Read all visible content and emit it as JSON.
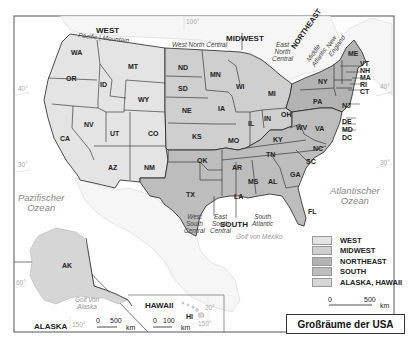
{
  "map": {
    "title": "Großräume der USA",
    "colors": {
      "west": "#e4e4e4",
      "midwest": "#cfcfcf",
      "northeast": "#b3b3b3",
      "south": "#bdbdbd",
      "alaska_hawaii": "#d6d6d6",
      "land_outside": "#f5f5f5",
      "water": "#ffffff",
      "border": "#222222"
    },
    "regions": {
      "west": {
        "label": "WEST",
        "divisions": [
          "Pacific",
          "Mountain"
        ]
      },
      "midwest": {
        "label": "MIDWEST",
        "divisions": [
          "West North Central",
          "East North Central"
        ]
      },
      "northeast": {
        "label": "NORTHEAST",
        "divisions": [
          "Middle Atlantic",
          "New England"
        ]
      },
      "south": {
        "label": "SOUTH",
        "divisions": [
          "West South Central",
          "East South Central",
          "South Atlantic"
        ]
      }
    },
    "division_labels": {
      "pacific_mountain": "Pacific | Mountain",
      "west_north_central": "West North Central",
      "east_north_central": [
        "East",
        "North",
        "Central"
      ],
      "middle_atlantic": [
        "Middle",
        "Atlantic"
      ],
      "new_england": [
        "New",
        "England"
      ],
      "west_south_central": [
        "West",
        "South",
        "Central"
      ],
      "east_south_central": [
        "East",
        "South",
        "Central"
      ],
      "south_atlantic": [
        "South",
        "Atlantic"
      ]
    },
    "states": [
      "WA",
      "OR",
      "ID",
      "MT",
      "WY",
      "CA",
      "NV",
      "UT",
      "CO",
      "AZ",
      "NM",
      "ND",
      "SD",
      "NE",
      "KS",
      "MN",
      "IA",
      "MO",
      "WI",
      "IL",
      "MI",
      "IN",
      "OH",
      "KY",
      "TN",
      "MS",
      "AL",
      "OK",
      "TX",
      "AR",
      "LA",
      "GA",
      "FL",
      "SC",
      "NC",
      "VA",
      "WV",
      "MD",
      "DE",
      "DC",
      "PA",
      "NY",
      "NJ",
      "CT",
      "RI",
      "MA",
      "NH",
      "VT",
      "ME",
      "AK",
      "HI"
    ],
    "water_labels": {
      "pacific": [
        "Pazifischer",
        "Ozean"
      ],
      "atlantic": [
        "Atlantischer",
        "Ozean"
      ],
      "gulf_mexico": "Golf von Mexiko",
      "gulf_alaska": [
        "Golf von",
        "Alaska"
      ]
    },
    "gridlines": {
      "lon_100": "100°",
      "lat_40_left": "40°",
      "lat_40_right": "40°",
      "lat_30_left": "30°",
      "lat_30_right": "30°",
      "lat_60": "60°",
      "lon_150_ak": "150°",
      "lat_20_hi": "20°",
      "lon_150_hi": "150°"
    },
    "insets": {
      "alaska": {
        "label": "ALASKA",
        "state": "AK",
        "scale": {
          "zero": "0",
          "value": "500",
          "unit": "km"
        }
      },
      "hawaii": {
        "label": "HAWAII",
        "state": "HI",
        "scale": {
          "zero": "0",
          "value": "100",
          "unit": "km"
        }
      }
    },
    "main_scale": {
      "zero": "0",
      "value": "500",
      "unit": "km"
    }
  },
  "legend": {
    "items": [
      {
        "label": "WEST",
        "color": "#e4e4e4"
      },
      {
        "label": "MIDWEST",
        "color": "#cfcfcf"
      },
      {
        "label": "NORTHEAST",
        "color": "#b3b3b3"
      },
      {
        "label": "SOUTH",
        "color": "#bdbdbd"
      },
      {
        "label": "ALASKA, HAWAII",
        "color": "#d6d6d6"
      }
    ]
  }
}
